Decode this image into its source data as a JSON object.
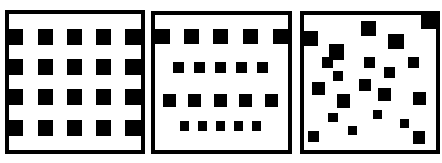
{
  "figure": {
    "colors": {
      "background": "#ffffff",
      "ink": "#000000"
    },
    "panels": [
      {
        "name": "regular-grid",
        "box": [
          5,
          10,
          140,
          144
        ],
        "squares": [
          [
            7,
            29,
            16,
            16
          ],
          [
            38,
            29,
            15,
            16
          ],
          [
            67,
            29,
            15,
            16
          ],
          [
            96,
            29,
            15,
            16
          ],
          [
            125,
            29,
            16,
            16
          ],
          [
            7,
            59,
            16,
            16
          ],
          [
            38,
            59,
            15,
            16
          ],
          [
            67,
            59,
            15,
            16
          ],
          [
            96,
            59,
            15,
            16
          ],
          [
            125,
            59,
            16,
            16
          ],
          [
            7,
            89,
            16,
            16
          ],
          [
            38,
            89,
            15,
            16
          ],
          [
            67,
            89,
            15,
            16
          ],
          [
            96,
            89,
            15,
            16
          ],
          [
            125,
            89,
            16,
            16
          ],
          [
            7,
            120,
            16,
            16
          ],
          [
            38,
            120,
            15,
            16
          ],
          [
            67,
            120,
            15,
            16
          ],
          [
            96,
            120,
            15,
            16
          ],
          [
            125,
            120,
            16,
            16
          ]
        ]
      },
      {
        "name": "graded-rows",
        "box": [
          151,
          11,
          141,
          143
        ],
        "squares": [
          [
            155,
            29,
            15,
            15
          ],
          [
            184,
            29,
            15,
            15
          ],
          [
            213,
            29,
            15,
            15
          ],
          [
            243,
            29,
            15,
            15
          ],
          [
            273,
            29,
            16,
            15
          ],
          [
            173,
            62,
            11,
            11
          ],
          [
            194,
            62,
            11,
            11
          ],
          [
            215,
            62,
            11,
            11
          ],
          [
            236,
            62,
            11,
            11
          ],
          [
            257,
            62,
            11,
            11
          ],
          [
            163,
            94,
            13,
            13
          ],
          [
            188,
            94,
            13,
            13
          ],
          [
            214,
            94,
            13,
            13
          ],
          [
            239,
            94,
            13,
            13
          ],
          [
            265,
            94,
            13,
            13
          ],
          [
            180,
            121,
            9,
            10
          ],
          [
            198,
            121,
            9,
            10
          ],
          [
            216,
            121,
            9,
            10
          ],
          [
            234,
            121,
            9,
            10
          ],
          [
            252,
            121,
            9,
            10
          ]
        ]
      },
      {
        "name": "random-scatter",
        "box": [
          300,
          11,
          140,
          143
        ],
        "squares": [
          [
            304,
            31,
            14,
            15
          ],
          [
            361,
            21,
            15,
            15
          ],
          [
            388,
            34,
            16,
            15
          ],
          [
            421,
            14,
            16,
            15
          ],
          [
            329,
            44,
            15,
            16
          ],
          [
            322,
            57,
            11,
            11
          ],
          [
            364,
            57,
            11,
            11
          ],
          [
            408,
            57,
            11,
            11
          ],
          [
            384,
            67,
            11,
            11
          ],
          [
            333,
            71,
            10,
            10
          ],
          [
            312,
            82,
            13,
            13
          ],
          [
            359,
            79,
            12,
            12
          ],
          [
            378,
            88,
            13,
            13
          ],
          [
            413,
            92,
            13,
            13
          ],
          [
            337,
            94,
            13,
            14
          ],
          [
            373,
            110,
            9,
            9
          ],
          [
            328,
            113,
            10,
            9
          ],
          [
            400,
            119,
            9,
            9
          ],
          [
            348,
            126,
            9,
            9
          ],
          [
            308,
            131,
            11,
            11
          ],
          [
            413,
            131,
            12,
            13
          ]
        ]
      }
    ]
  }
}
